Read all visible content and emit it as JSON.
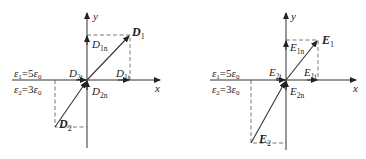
{
  "diagrams": [
    {
      "id": "D-field",
      "axis_x_label": "x",
      "axis_y_label": "y",
      "eps1": {
        "sym": "ε",
        "sub": "1",
        "eq": "=5",
        "sym2": "ε",
        "sub2": "0"
      },
      "eps2": {
        "sym": "ε",
        "sub": "2",
        "eq": "=3",
        "sym2": "ε",
        "sub2": "0"
      },
      "v1": {
        "base": "D",
        "sub": "1"
      },
      "v2": {
        "base": "D",
        "sub": "2"
      },
      "v1n": {
        "base": "D",
        "sub": "1n"
      },
      "v1t": {
        "base": "D",
        "sub": "1t"
      },
      "v2t": {
        "base": "D",
        "sub": "2t"
      },
      "v2n": {
        "base": "D",
        "sub": "2n"
      }
    },
    {
      "id": "E-field",
      "axis_x_label": "x",
      "axis_y_label": "y",
      "eps1": {
        "sym": "ε",
        "sub": "1",
        "eq": "=5",
        "sym2": "ε",
        "sub2": "0"
      },
      "eps2": {
        "sym": "ε",
        "sub": "2",
        "eq": "=3",
        "sym2": "ε",
        "sub2": "0"
      },
      "v1": {
        "base": "E",
        "sub": "1"
      },
      "v2": {
        "base": "E",
        "sub": "2"
      },
      "v1n": {
        "base": "E",
        "sub": "1n"
      },
      "v1t": {
        "base": "E",
        "sub": "1t"
      },
      "v2t": {
        "base": "E",
        "sub": "2t"
      },
      "v2n": {
        "base": "E",
        "sub": "2n"
      }
    }
  ]
}
